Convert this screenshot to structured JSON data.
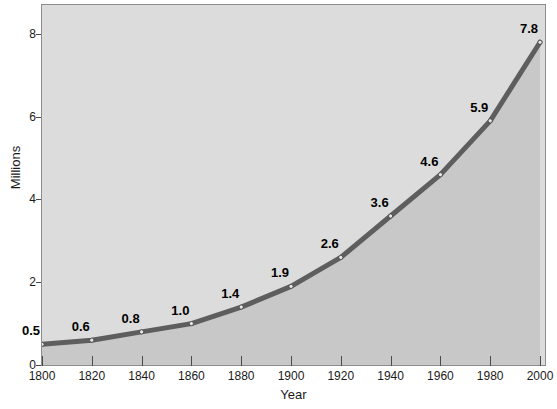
{
  "chart_data": {
    "type": "area",
    "title": "",
    "xlabel": "Year",
    "ylabel": "Millions",
    "x": [
      1800,
      1820,
      1840,
      1860,
      1880,
      1900,
      1920,
      1940,
      1960,
      1980,
      2000
    ],
    "values": [
      0.5,
      0.6,
      0.8,
      1.0,
      1.4,
      1.9,
      2.6,
      3.6,
      4.6,
      5.9,
      7.8
    ],
    "point_labels": [
      "0.5",
      "0.6",
      "0.8",
      "1.0",
      "1.4",
      "1.9",
      "2.6",
      "3.6",
      "4.6",
      "5.9",
      "7.8"
    ],
    "xlim": [
      1800,
      2002
    ],
    "ylim": [
      0,
      8.7
    ],
    "xticks": [
      1800,
      1820,
      1840,
      1860,
      1880,
      1900,
      1920,
      1940,
      1960,
      1980,
      2000
    ],
    "xtick_labels": [
      "1800",
      "1820",
      "1840",
      "1860",
      "1880",
      "1900",
      "1920",
      "1940",
      "1960",
      "1980",
      "2000"
    ],
    "yticks": [
      0,
      2,
      4,
      6,
      8
    ],
    "ytick_labels": [
      "0",
      "2",
      "4",
      "6",
      "8"
    ],
    "grid": false,
    "legend": null,
    "colors": {
      "line": "#5e5e5e",
      "marker_fill": "#e8e8e8",
      "marker_edge": "#3f3f3f",
      "fill_below": "#c8c8c8",
      "fill_above": "#dcdcdc",
      "frame": "#8d8d8d",
      "text": "#1a1a1a",
      "label_text": "#000000",
      "page_background": "#ffffff"
    }
  },
  "axes": {
    "y_title": "Millions",
    "x_title": "Year"
  }
}
